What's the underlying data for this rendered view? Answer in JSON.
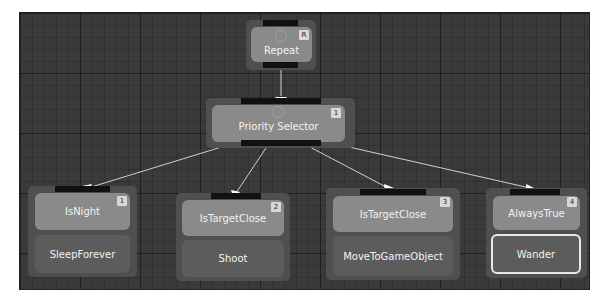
{
  "editor": {
    "title": "Behavior Tree"
  },
  "nodes": {
    "repeat": {
      "label": "Repeat",
      "badge": "R",
      "icon": "repeat-icon"
    },
    "priority_selector": {
      "label": "Priority Selector",
      "badge": "1",
      "icon": "selector-icon"
    },
    "branches": [
      {
        "condition": "IsNight",
        "index": "1",
        "action": "SleepForever",
        "selected": false
      },
      {
        "condition": "IsTargetClose",
        "index": "2",
        "action": "Shoot",
        "selected": false
      },
      {
        "condition": "IsTargetClose",
        "index": "3",
        "action": "MoveToGameObject",
        "selected": false
      },
      {
        "condition": "AlwaysTrue",
        "index": "4",
        "action": "Wander",
        "selected": true
      }
    ]
  },
  "colors": {
    "canvas": "#3a3a3a",
    "node_frame": "#4f4f4f",
    "condition_fill": "#8a8a8a",
    "action_fill": "#5c5c5c",
    "edge": "#d0d0d0",
    "selection_border": "#e8e8e8"
  }
}
